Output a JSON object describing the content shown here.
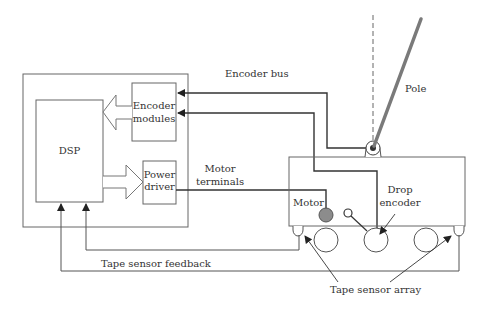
{
  "diagram": {
    "colors": {
      "line": "#333333",
      "thin_line": "#555555",
      "pole": "#7a7a7a",
      "motor_fill": "#8c8c8c",
      "background": "#ffffff"
    },
    "blocks": {
      "controller_box": {
        "label": ""
      },
      "dsp": {
        "label": "DSP"
      },
      "encoder_modules": {
        "line1": "Encoder",
        "line2": "modules"
      },
      "power_driver": {
        "line1": "Power",
        "line2": "driver"
      },
      "cart": {
        "label": ""
      }
    },
    "labels": {
      "encoder_bus": "Encoder bus",
      "pole": "Pole",
      "motor_terminals_1": "Motor",
      "motor_terminals_2": "terminals",
      "motor": "Motor",
      "drop_encoder_1": "Drop",
      "drop_encoder_2": "encoder",
      "tape_sensor_feedback": "Tape sensor feedback",
      "tape_sensor_array": "Tape sensor array"
    },
    "icons": {
      "pivot": "pivot-joint-icon",
      "motor": "motor-icon",
      "wheel": "wheel-icon",
      "sensor": "tape-sensor-icon"
    }
  }
}
